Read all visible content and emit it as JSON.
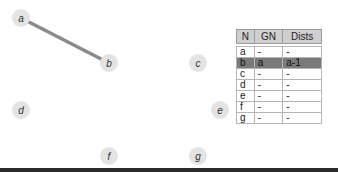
{
  "graph": {
    "nodes": [
      {
        "id": "a",
        "label": "a",
        "x": 21,
        "y": 18
      },
      {
        "id": "b",
        "label": "b",
        "x": 109,
        "y": 63
      },
      {
        "id": "c",
        "label": "c",
        "x": 198,
        "y": 63
      },
      {
        "id": "d",
        "label": "d",
        "x": 21,
        "y": 110
      },
      {
        "id": "e",
        "label": "e",
        "x": 220,
        "y": 110
      },
      {
        "id": "f",
        "label": "f",
        "x": 109,
        "y": 156
      },
      {
        "id": "g",
        "label": "g",
        "x": 198,
        "y": 156
      }
    ],
    "edges": [
      {
        "from": "a",
        "to": "b",
        "color": "#8a8a8a"
      }
    ]
  },
  "table": {
    "headers": [
      "N",
      "GN",
      "Dists"
    ],
    "rows": [
      {
        "n": "a",
        "gn": "-",
        "dists": "-"
      },
      {
        "n": "b",
        "gn": "a",
        "dists": "a-1",
        "highlight": true
      },
      {
        "n": "c",
        "gn": "-",
        "dists": "-"
      },
      {
        "n": "d",
        "gn": "-",
        "dists": "-"
      },
      {
        "n": "e",
        "gn": "-",
        "dists": "-"
      },
      {
        "n": "f",
        "gn": "-",
        "dists": "-"
      },
      {
        "n": "g",
        "gn": "-",
        "dists": "-"
      }
    ]
  }
}
